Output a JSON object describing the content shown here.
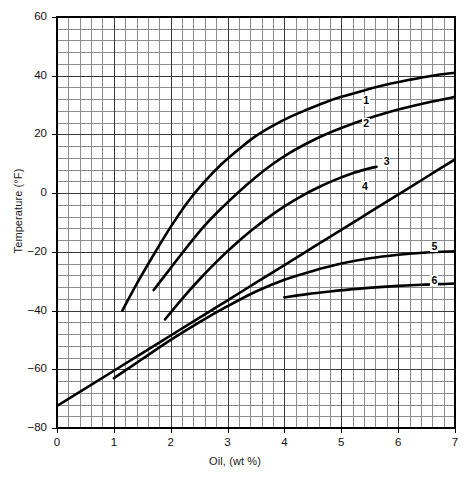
{
  "chart_data": {
    "type": "line",
    "title": "",
    "xlabel": "Oil, (wt %)",
    "ylabel": "Temperature (°F)",
    "xlim": [
      0,
      7
    ],
    "ylim": [
      -80,
      60
    ],
    "xticks": [
      "0",
      "1",
      "2",
      "3",
      "4",
      "5",
      "6",
      "7"
    ],
    "yticks": [
      "60",
      "40",
      "20",
      "0",
      "−20",
      "−40",
      "−60",
      "−80"
    ],
    "grid": "major and minor grid, 5 minor divisions per major cell",
    "legend": "inline curve numbers at right end of each curve",
    "series": [
      {
        "name": "1",
        "label": "1",
        "label_x": 5.42,
        "label_y": 31.5,
        "points": [
          [
            1.15,
            -40.0
          ],
          [
            1.4,
            -31.0
          ],
          [
            1.7,
            -21.0
          ],
          [
            2.0,
            -11.5
          ],
          [
            2.3,
            -3.0
          ],
          [
            2.6,
            4.0
          ],
          [
            2.9,
            10.0
          ],
          [
            3.2,
            15.0
          ],
          [
            3.5,
            19.5
          ],
          [
            3.8,
            23.0
          ],
          [
            4.1,
            26.0
          ],
          [
            4.4,
            28.5
          ],
          [
            4.7,
            30.8
          ],
          [
            5.0,
            32.8
          ],
          [
            5.4,
            35.0
          ],
          [
            5.8,
            37.0
          ],
          [
            6.2,
            38.6
          ],
          [
            6.6,
            40.0
          ],
          [
            7.0,
            41.0
          ]
        ]
      },
      {
        "name": "2",
        "label": "2",
        "label_x": 5.42,
        "label_y": 23.5,
        "points": [
          [
            1.7,
            -33.0
          ],
          [
            2.0,
            -25.5
          ],
          [
            2.3,
            -18.0
          ],
          [
            2.6,
            -11.0
          ],
          [
            2.9,
            -5.0
          ],
          [
            3.2,
            0.5
          ],
          [
            3.5,
            5.5
          ],
          [
            3.8,
            10.0
          ],
          [
            4.1,
            13.8
          ],
          [
            4.4,
            17.0
          ],
          [
            4.7,
            19.8
          ],
          [
            5.0,
            22.2
          ],
          [
            5.4,
            25.0
          ],
          [
            5.8,
            27.4
          ],
          [
            6.2,
            29.4
          ],
          [
            6.6,
            31.2
          ],
          [
            7.0,
            32.8
          ]
        ]
      },
      {
        "name": "3",
        "label": "3",
        "label_x": 5.78,
        "label_y": 10.5,
        "points": [
          [
            1.9,
            -43.0
          ],
          [
            2.2,
            -36.0
          ],
          [
            2.5,
            -29.5
          ],
          [
            2.8,
            -23.5
          ],
          [
            3.1,
            -18.0
          ],
          [
            3.4,
            -13.0
          ],
          [
            3.7,
            -8.5
          ],
          [
            4.0,
            -4.5
          ],
          [
            4.3,
            -1.0
          ],
          [
            4.6,
            2.0
          ],
          [
            4.9,
            4.6
          ],
          [
            5.2,
            6.8
          ],
          [
            5.45,
            8.2
          ],
          [
            5.62,
            9.0
          ]
        ]
      },
      {
        "name": "4",
        "label": "4",
        "label_x": 5.4,
        "label_y": 2.0,
        "points": [
          [
            0.0,
            -72.5
          ],
          [
            0.5,
            -66.5
          ],
          [
            1.0,
            -60.5
          ],
          [
            1.5,
            -54.5
          ],
          [
            2.0,
            -48.5
          ],
          [
            2.5,
            -42.5
          ],
          [
            3.0,
            -36.5
          ],
          [
            3.5,
            -30.5
          ],
          [
            4.0,
            -24.5
          ],
          [
            4.5,
            -18.5
          ],
          [
            5.0,
            -12.5
          ],
          [
            5.5,
            -6.5
          ],
          [
            6.0,
            -0.5
          ],
          [
            6.5,
            5.5
          ],
          [
            7.0,
            11.5
          ]
        ]
      },
      {
        "name": "5",
        "label": "5",
        "label_x": 6.62,
        "label_y": -18.5,
        "points": [
          [
            1.0,
            -63.0
          ],
          [
            1.5,
            -56.5
          ],
          [
            2.0,
            -50.0
          ],
          [
            2.5,
            -44.0
          ],
          [
            3.0,
            -38.5
          ],
          [
            3.5,
            -33.5
          ],
          [
            4.0,
            -29.5
          ],
          [
            4.5,
            -26.5
          ],
          [
            5.0,
            -24.0
          ],
          [
            5.5,
            -22.2
          ],
          [
            6.0,
            -21.0
          ],
          [
            6.5,
            -20.2
          ],
          [
            7.0,
            -19.8
          ]
        ]
      },
      {
        "name": "6",
        "label": "6",
        "label_x": 6.62,
        "label_y": -30.0,
        "points": [
          [
            4.0,
            -35.5
          ],
          [
            4.4,
            -34.4
          ],
          [
            4.8,
            -33.5
          ],
          [
            5.2,
            -32.7
          ],
          [
            5.6,
            -32.1
          ],
          [
            6.0,
            -31.6
          ],
          [
            6.4,
            -31.2
          ],
          [
            6.7,
            -31.0
          ],
          [
            7.0,
            -30.8
          ]
        ]
      }
    ]
  },
  "plot": {
    "left_px": 57,
    "top_px": 17,
    "right_px": 455,
    "bottom_px": 428,
    "colors": {
      "curve": "#000000",
      "major_grid": "#3a3a3a",
      "minor_grid": "#8c8c8c",
      "frame": "#000000",
      "background": "#ffffff"
    }
  }
}
